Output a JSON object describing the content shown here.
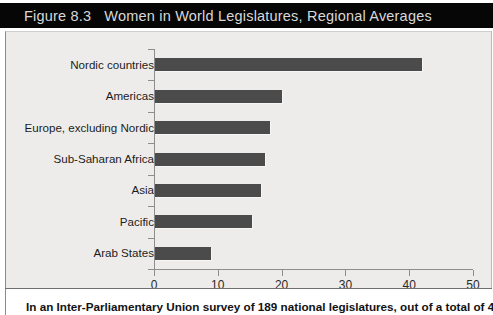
{
  "figure": {
    "number_label": "Figure 8.3",
    "title": "Women in World Legislatures, Regional Averages",
    "caption": "In an Inter-Parliamentary Union survey of 189 national legislatures, out of a total of 43,374"
  },
  "colors": {
    "title_band": "#060606",
    "title_text": "#d8d8d8",
    "plot_background": "#eeecea",
    "bar": "#4b4b4b",
    "axis": "#8d8d8d"
  },
  "chart_data": {
    "type": "bar",
    "orientation": "horizontal",
    "title": "Women in World Legislatures, Regional Averages",
    "xlabel": "",
    "ylabel": "",
    "categories": [
      "Nordic countries",
      "Americas",
      "Europe, excluding Nordic",
      "Sub-Saharan Africa",
      "Asia",
      "Pacific",
      "Arab States"
    ],
    "values": [
      41.8,
      19.9,
      18.0,
      17.3,
      16.6,
      15.2,
      8.8
    ],
    "xlim": [
      0,
      50
    ],
    "xticks": [
      0,
      10,
      20,
      30,
      40,
      50
    ],
    "xtick_labels": [
      "0",
      "10",
      "20",
      "30",
      "40",
      "50"
    ],
    "grid": false,
    "legend": null
  }
}
